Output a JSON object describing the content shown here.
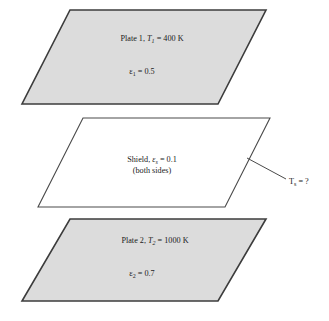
{
  "figure": {
    "name": "radiation-shield-between-parallel-plates",
    "background": "#ffffff"
  },
  "colors": {
    "plate_fill": "#dcdcdc",
    "plate_stroke": "#3c3c3c",
    "shield_fill": "#ffffff",
    "shield_stroke": "#4a4a4a",
    "text": "#1a1a1a",
    "leader": "#4a4a4a"
  },
  "plate1": {
    "title_prefix": "Plate 1, ",
    "title_symbol": "T",
    "title_subscript": "1",
    "title_value": " = 400 K",
    "emissivity_symbol": "ε",
    "emissivity_subscript": "1",
    "emissivity_value": " = 0.5"
  },
  "shield": {
    "title_prefix": "Shield, ",
    "title_symbol": "ε",
    "title_subscript": "s",
    "title_value": " = 0.1",
    "note": "(both sides)"
  },
  "plate2": {
    "title_prefix": "Plate 2, ",
    "title_symbol": "T",
    "title_subscript": "2",
    "title_value": " = 1000 K",
    "emissivity_symbol": "ε",
    "emissivity_subscript": "2",
    "emissivity_value": " = 0.7"
  },
  "callout": {
    "symbol": "T",
    "subscript": "s",
    "value": " = ?"
  }
}
